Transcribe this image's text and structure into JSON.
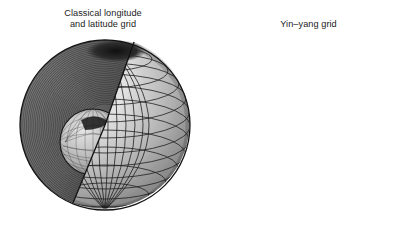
{
  "figure": {
    "background_color": "#ffffff",
    "text_color": "#1c1c1c",
    "width": 411,
    "height": 225
  },
  "panels": [
    {
      "id": "classical-grid",
      "caption": "Classical longitude\nand latitude grid",
      "sphere": {
        "type": "cutaway-sphere",
        "description": "Sphere with a wedge sector cut away exposing dense radial shell layers and an inner core sphere",
        "surface_grid": "longitude-latitude",
        "longitude_lines": 24,
        "latitude_lines": 16,
        "pole_convergence": true,
        "has_inner_core": true,
        "inner_core_grid": "longitude-latitude",
        "shell_layers": 46,
        "cut_wedge_degrees": 90,
        "shading": "grayscale-lambert",
        "colors": {
          "surface_light": "#f2f2f2",
          "surface_mid": "#b8b8b8",
          "surface_dark": "#6e6e6e",
          "cut_face_light": "#9a9a9a",
          "cut_face_dark": "#3a3a3a",
          "grid_line": "#1a1a1a",
          "pole_shadow": "#141414",
          "core_light": "#dcdcdc",
          "core_dark": "#787878"
        }
      }
    },
    {
      "id": "yinyang-grid",
      "caption": "Yin–yang grid",
      "sphere": {
        "type": "overset-sphere",
        "description": "Full sphere covered by two identical overlapping curved patches forming a quasi-uniform mesh with no polar singularity",
        "surface_grid": "yin-yang",
        "patch_count": 2,
        "patch_names": [
          "yin",
          "yang"
        ],
        "cells_across": 17,
        "cells_down": 15,
        "pole_convergence": false,
        "has_inner_core": false,
        "seam_visible": true,
        "shading": "grayscale-lambert",
        "colors": {
          "surface_light": "#fbfbfb",
          "surface_mid": "#c4c4c4",
          "surface_dark": "#7a7a7a",
          "patch_yin_tint": "#a9a9a9",
          "patch_yang_tint": "#ededed",
          "grid_line": "#1a1a1a",
          "seam_line": "#2a2a2a"
        }
      }
    }
  ]
}
